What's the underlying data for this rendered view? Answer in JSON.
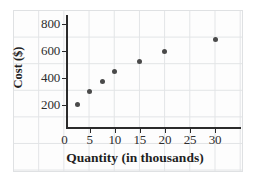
{
  "chart_data": {
    "type": "scatter",
    "title": "",
    "xlabel": "Quantity (in thousands)",
    "ylabel": "Cost ($)",
    "xlim": [
      0,
      34
    ],
    "ylim": [
      0,
      880
    ],
    "grid": true,
    "legend": null,
    "xticks": [
      0,
      5,
      10,
      15,
      20,
      25,
      30
    ],
    "xtick_labels": [
      "0",
      "5",
      "10",
      "15",
      "20",
      "25",
      "30"
    ],
    "yticks": [
      200,
      400,
      600,
      800
    ],
    "ytick_labels": [
      "200",
      "400",
      "600",
      "800"
    ],
    "series": [
      {
        "name": "Cost vs Quantity",
        "marker": "filled-circle",
        "color": "#4a4a4a",
        "points": [
          {
            "x": 2.5,
            "y": 200
          },
          {
            "x": 5,
            "y": 300
          },
          {
            "x": 7.5,
            "y": 375
          },
          {
            "x": 10,
            "y": 450
          },
          {
            "x": 15,
            "y": 520
          },
          {
            "x": 20,
            "y": 600
          },
          {
            "x": 30,
            "y": 690
          }
        ]
      }
    ]
  },
  "colors": {
    "marker": "#4a4a4a",
    "axis": "#2b2b2b",
    "grid": "#e2e4e6",
    "background": "#ffffff",
    "text": "#1f1f1f"
  }
}
